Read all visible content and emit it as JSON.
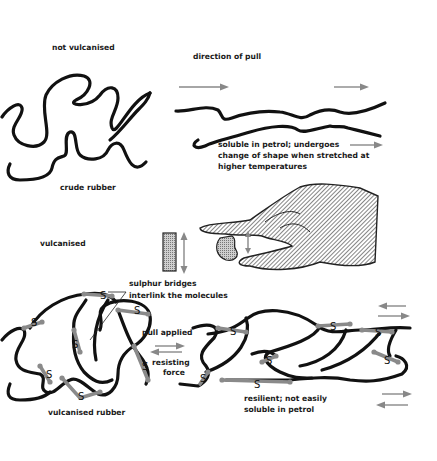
{
  "labels": {
    "not_vulcanised": "not vulcanised",
    "direction_of_pull": "direction of pull",
    "crude_rubber": "crude rubber",
    "soluble_line1": "soluble in petrol; undergoes",
    "soluble_line2": "change of shape when stretched at",
    "soluble_line3": "higher temperatures",
    "vulcanised": "vulcanised",
    "sulphur_line1": "sulphur bridges",
    "sulphur_line2": "interlink the molecules",
    "pull_applied": "pull applied",
    "resisting_line1": "resisting",
    "resisting_line2": "force",
    "vulcanised_rubber": "vulcanised rubber",
    "resilient_line1": "resilient; not easily",
    "resilient_line2": "soluble in petrol"
  },
  "bridge_symbol": "S",
  "colors": {
    "chain": "#111111",
    "bridge": "#8a8a8a",
    "arrow": "#888888",
    "hatch": "#555555"
  }
}
